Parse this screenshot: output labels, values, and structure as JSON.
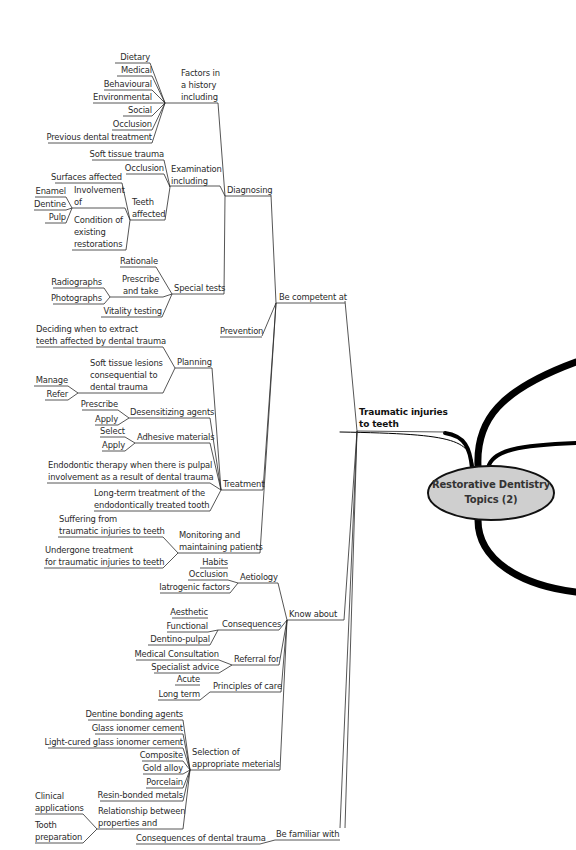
{
  "central_node": {
    "label_line1": "Restorative Dentistry",
    "label_line2": "Topics (2)",
    "fill_color": "#cfcfcf",
    "stroke_color": "#111111"
  },
  "main_branch": {
    "label_line1": "Traumatic injuries",
    "label_line2": "to teeth"
  },
  "branches": {
    "be_competent_at": {
      "label": "Be competent at",
      "diagnosing": {
        "label": "Diagnosing",
        "history": {
          "label_lines": [
            "Factors in",
            "a history",
            "including"
          ],
          "items": [
            "Dietary",
            "Medical",
            "Behavioural",
            "Environmental",
            "Social",
            "Occlusion",
            "Previous dental treatment"
          ]
        },
        "examination": {
          "label_lines": [
            "Examination",
            "including"
          ],
          "items": [
            "Soft tissue trauma",
            "Occlusion"
          ],
          "teeth_affected": {
            "label_lines": [
              "Teeth",
              "affected"
            ],
            "items": [
              "Surfaces affected"
            ],
            "involvement": {
              "label_lines": [
                "Involvement",
                "of"
              ],
              "items": [
                "Enamel",
                "Dentine",
                "Pulp"
              ]
            },
            "condition": {
              "label_lines": [
                "Condition of",
                "existing",
                "restorations"
              ]
            }
          }
        },
        "special_tests": {
          "label": "Special tests",
          "items": [
            "Rationale",
            "Vitality testing"
          ],
          "prescribe": {
            "label_lines": [
              "Prescribe",
              "and take"
            ],
            "items": [
              "Radiographs",
              "Photographs"
            ]
          }
        }
      },
      "prevention": {
        "label": "Prevention"
      },
      "treatment": {
        "label": "Treatment",
        "planning": {
          "label": "Planning",
          "extract_lines": [
            "Deciding when to extract",
            "teeth affected by dental trauma"
          ],
          "soft_tissue": {
            "label_lines": [
              "Soft tissue lesions",
              "consequential to",
              "dental trauma"
            ],
            "items": [
              "Manage",
              "Refer"
            ]
          }
        },
        "desensitizing": {
          "label": "Desensitizing agents",
          "items": [
            "Prescribe",
            "Apply"
          ]
        },
        "adhesive": {
          "label": "Adhesive materials",
          "items": [
            "Select",
            "Apply"
          ]
        },
        "endodontic_lines": [
          "Endodontic therapy when there is pulpal",
          "involvement as a result of dental trauma"
        ],
        "long_term_lines": [
          "Long-term treatment of the",
          "endodontically treated tooth"
        ]
      },
      "monitoring": {
        "label_lines": [
          "Monitoring and",
          "maintaining patients"
        ],
        "suffering_lines": [
          "Suffering from",
          "traumatic injuries to teeth"
        ],
        "undergone_lines": [
          "Undergone treatment",
          "for traumatic injuries to teeth"
        ]
      }
    },
    "know_about": {
      "label": "Know about",
      "aetiology": {
        "label": "Aetiology",
        "items": [
          "Habits",
          "Occlusion",
          "Iatrogenic factors"
        ]
      },
      "consequences": {
        "label": "Consequences",
        "items": [
          "Aesthetic",
          "Functional",
          "Dentino-pulpal"
        ]
      },
      "referral": {
        "label": "Referral for",
        "items": [
          "Medical Consultation",
          "Specialist advice"
        ]
      },
      "principles": {
        "label": "Principles of care",
        "items": [
          "Acute",
          "Long term"
        ]
      },
      "materials": {
        "label_lines": [
          "Selection of",
          "appropriate meterials"
        ],
        "items": [
          "Dentine bonding agents",
          "Glass ionomer cement",
          "Light-cured glass ionomer cement",
          "Composite",
          "Gold alloy",
          "Porcelain",
          "Resin-bonded metals"
        ],
        "relationship": {
          "label_lines": [
            "Relationship between",
            "properties and"
          ],
          "clinical_lines": [
            "Clinical",
            "applications"
          ],
          "tooth_lines": [
            "Tooth",
            "preparation"
          ]
        }
      }
    },
    "be_familiar_with": {
      "label": "Be familiar with",
      "items": [
        "Consequences of dental trauma"
      ]
    }
  }
}
